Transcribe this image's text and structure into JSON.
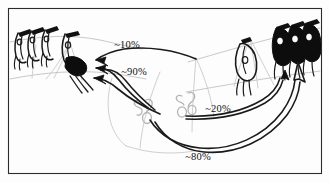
{
  "figure": {
    "type": "hand-drawn-schematic",
    "title": "",
    "frame": {
      "border_color": "#2b2b2b",
      "border_width_px": 1,
      "background_color": "#fdfdfd",
      "inset_px": 8
    },
    "ink_colors": {
      "dark_ink": "#1a1a1a",
      "mid_ink": "#3a3a3a",
      "light_pencil": "#b9b9b9",
      "fill_black": "#0d0d0d",
      "paper": "#fdfdfd"
    }
  },
  "flow_labels": [
    {
      "id": "flow-10",
      "text": "~10%",
      "value": 10,
      "unit": "%",
      "approx": true,
      "direction": "right-to-left",
      "x": 127,
      "y": 48
    },
    {
      "id": "flow-90",
      "text": "~90%",
      "value": 90,
      "unit": "%",
      "approx": true,
      "direction": "right-to-left",
      "x": 131,
      "y": 74
    },
    {
      "id": "flow-20",
      "text": "~20%",
      "value": 20,
      "unit": "%",
      "approx": true,
      "direction": "left-to-right",
      "x": 216,
      "y": 111
    },
    {
      "id": "flow-80",
      "text": "~80%",
      "value": 80,
      "unit": "%",
      "approx": true,
      "direction": "left-to-right",
      "x": 196,
      "y": 156
    }
  ],
  "groups": {
    "left_cluster": {
      "name": "left-figure-cluster",
      "count": 3,
      "fill": "outline-with-dark-heads",
      "note": "three hanging stylized figures on a sloping line"
    },
    "left_single": {
      "name": "left-single-figure",
      "count": 1,
      "fill": "dark-filled-body"
    },
    "right_single": {
      "name": "right-single-figure",
      "count": 1,
      "fill": "outline"
    },
    "right_cluster": {
      "name": "right-figure-cluster",
      "count": 3,
      "fill": "solid-black-bodies"
    },
    "center_blobs_left": {
      "name": "center-blob-cluster-left",
      "count": 3,
      "fill": "light-pencil-outline"
    },
    "center_blobs_right": {
      "name": "center-blob-cluster-right",
      "count": 3,
      "fill": "light-pencil-outline"
    }
  }
}
